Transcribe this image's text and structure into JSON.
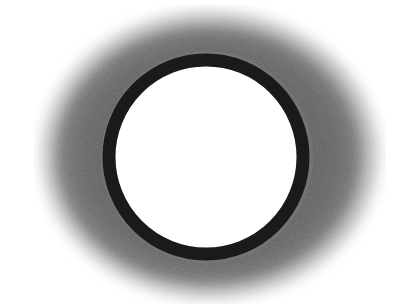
{
  "image": {
    "description": "Grayscale photograph of a dark circular ring with a white center, surrounded by a diffuse gray halo",
    "background_color": "#ffffff",
    "halo_color": "#6e6e6e",
    "ring_color": "#1a1a1a",
    "center_color": "#ffffff",
    "ring": {
      "cx": 206,
      "cy": 157,
      "rx": 103,
      "ry": 103,
      "stroke_width": 13
    },
    "halo": {
      "cx": 210,
      "cy": 155,
      "rx": 172,
      "ry": 145
    }
  }
}
